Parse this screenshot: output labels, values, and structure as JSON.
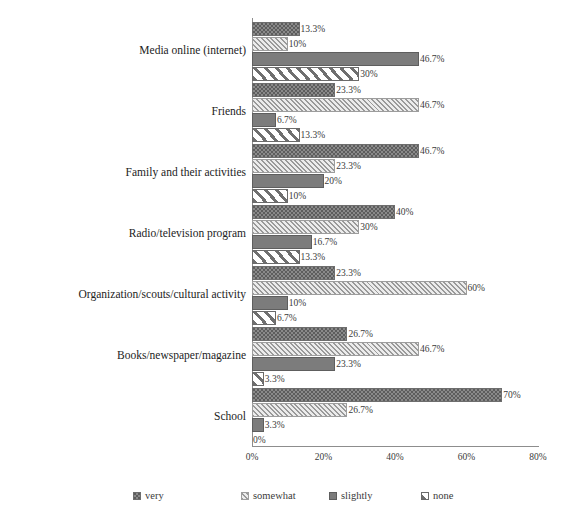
{
  "chart_data": {
    "type": "bar",
    "orientation": "horizontal",
    "title": "",
    "subtitle": "",
    "xlabel": "",
    "ylabel": "",
    "xlim": [
      0,
      80
    ],
    "xticks": [
      "0%",
      "20%",
      "40%",
      "60%",
      "80%"
    ],
    "xtick_values": [
      0,
      20,
      40,
      60,
      80
    ],
    "grid": false,
    "legend_position": "bottom",
    "categories": [
      "Media online (internet)",
      "Friends",
      "Family and their activities",
      "Radio/television program",
      "Organization/scouts/cultural activity",
      "Books/newspaper/magazine",
      "School"
    ],
    "series": [
      {
        "name": "very",
        "pattern": "dotted-dark",
        "color": "#8a8a8a",
        "values": [
          13.3,
          23.3,
          46.7,
          40,
          23.3,
          26.7,
          70
        ],
        "labels": [
          "13.3%",
          "23.3%",
          "46.7%",
          "40%",
          "23.3%",
          "26.7%",
          "70%"
        ]
      },
      {
        "name": "somewhat",
        "pattern": "diagonal-light",
        "color": "#e0e0e0",
        "values": [
          10,
          46.7,
          23.3,
          30,
          60,
          46.7,
          26.7
        ],
        "labels": [
          "10%",
          "46.7%",
          "23.3%",
          "30%",
          "60%",
          "46.7%",
          "26.7%"
        ]
      },
      {
        "name": "slightly",
        "pattern": "solid-gray",
        "color": "#7c7c7c",
        "values": [
          46.7,
          6.7,
          20,
          16.7,
          10,
          23.3,
          3.3
        ],
        "labels": [
          "46.7%",
          "6.7%",
          "20%",
          "16.7%",
          "10%",
          "23.3%",
          "3.3%"
        ]
      },
      {
        "name": "none",
        "pattern": "diagonal-stripe-white",
        "color": "#ffffff",
        "values": [
          30,
          13.3,
          10,
          13.3,
          6.7,
          3.3,
          0
        ],
        "labels": [
          "30%",
          "13.3%",
          "10%",
          "13.3%",
          "6.7%",
          "3.3%",
          "0%"
        ]
      }
    ]
  },
  "legend": {
    "items": [
      {
        "label": "very"
      },
      {
        "label": "somewhat"
      },
      {
        "label": "slightly"
      },
      {
        "label": "none"
      }
    ]
  }
}
